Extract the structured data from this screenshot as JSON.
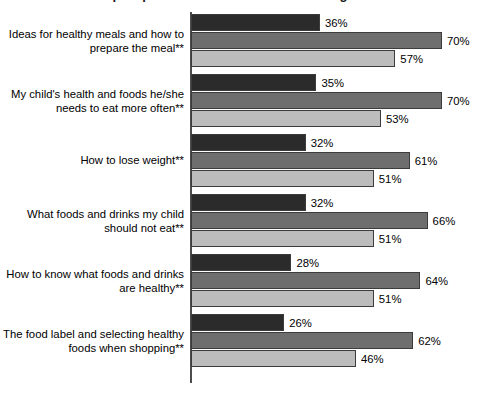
{
  "chart_data": {
    "type": "bar",
    "orientation": "horizontal",
    "title": "Topics parents are interested in learning about",
    "xlabel": "",
    "ylabel": "",
    "xlim": [
      0,
      80
    ],
    "grid": false,
    "legend_position": "none",
    "value_suffix": "%",
    "categories": [
      "Ideas for healthy meals and how to prepare the meal**",
      "My child's health and foods he/she needs to eat more often**",
      "How to lose weight**",
      "What foods and drinks my child should not eat**",
      "How to know what foods and drinks are healthy**",
      "The food label and selecting healthy foods when shopping**"
    ],
    "series": [
      {
        "name": "series-1",
        "color": "#2b2b2b",
        "values": [
          36,
          35,
          32,
          32,
          28,
          26
        ],
        "labels": [
          "36%",
          "35%",
          "32%",
          "32%",
          "28%",
          "26%"
        ]
      },
      {
        "name": "series-2",
        "color": "#6e6e6e",
        "values": [
          70,
          70,
          61,
          66,
          64,
          62
        ],
        "labels": [
          "70%",
          "70%",
          "61%",
          "66%",
          "64%",
          "62%"
        ]
      },
      {
        "name": "series-3",
        "color": "#bcbcbc",
        "values": [
          57,
          53,
          51,
          51,
          51,
          46
        ],
        "labels": [
          "57%",
          "53%",
          "51%",
          "51%",
          "51%",
          "46%"
        ]
      }
    ]
  }
}
